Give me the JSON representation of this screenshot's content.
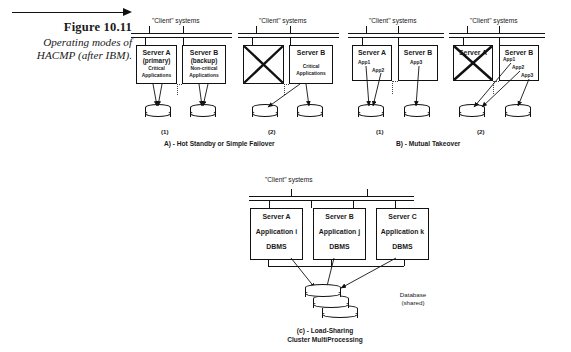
{
  "figure": {
    "number": "Figure 10.11",
    "caption": "Operating modes of HACMP (after IBM)."
  },
  "labels": {
    "client_systems": "\"Client\" systems",
    "panel_1": "(1)",
    "panel_2": "(2)",
    "section_a": "A) - Hot Standby or Simple Failover",
    "section_b": "B) -  Mutual Takeover",
    "bottom_caption_line1": "(c) -  Load-Sharing",
    "bottom_caption_line2": "Cluster MultiProcessing",
    "database_line1": "Database",
    "database_line2": "(shared)"
  },
  "panels": {
    "a1": {
      "client_label": "\"Client\" systems",
      "number": "(1)",
      "servers": [
        {
          "name": "Server A",
          "role": "(primary)",
          "sub1": "Critical",
          "sub2": "Applications",
          "failed": false
        },
        {
          "name": "Server B",
          "role": "(backup)",
          "sub1": "Non-critical",
          "sub2": "Applications",
          "failed": false
        }
      ]
    },
    "a2": {
      "client_label": "\"Client\" systems",
      "number": "(2)",
      "servers": [
        {
          "name": "",
          "role": "",
          "sub1": "",
          "sub2": "",
          "failed": true
        },
        {
          "name": "Server B",
          "role": "",
          "sub1": "Critical",
          "sub2": "Applications",
          "failed": false
        }
      ]
    },
    "b1": {
      "client_label": "\"Client\" systems",
      "number": "(1)",
      "servers": [
        {
          "name": "Server A",
          "apps": [
            "App1",
            "App2"
          ],
          "failed": false
        },
        {
          "name": "Server B",
          "apps": [
            "App3"
          ],
          "failed": false
        }
      ]
    },
    "b2": {
      "client_label": "\"Client\" systems",
      "number": "(2)",
      "servers": [
        {
          "name": "Server A",
          "apps": [],
          "failed": true
        },
        {
          "name": "Server B",
          "apps": [
            "App1",
            "App2",
            "App3"
          ],
          "failed": false
        }
      ]
    },
    "c": {
      "client_label": "\"Client\" systems",
      "servers": [
        {
          "name": "Server A",
          "application": "Application i",
          "dbms": "DBMS"
        },
        {
          "name": "Server B",
          "application": "Application j",
          "dbms": "DBMS"
        },
        {
          "name": "Server C",
          "application": "Application k",
          "dbms": "DBMS"
        }
      ]
    }
  }
}
